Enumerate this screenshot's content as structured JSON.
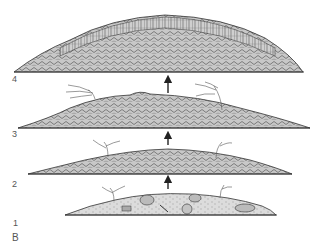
{
  "figure": {
    "panel_label": "B",
    "stages": [
      {
        "label": "1",
        "description": "sediment mound with scattered fossils and sea fans"
      },
      {
        "label": "2",
        "description": "mound with encrusting colonies and sea fans"
      },
      {
        "label": "3",
        "description": "reef mound with branching colonies"
      },
      {
        "label": "4",
        "description": "mature reef with vertical columnar colonies"
      }
    ],
    "arrows": [
      "up-arrow",
      "up-arrow",
      "up-arrow"
    ],
    "colors": {
      "line": "#333333",
      "fill_sediment": "#d9d9d9",
      "fill_reef": "#bdbdbd",
      "label": "#555555"
    }
  }
}
